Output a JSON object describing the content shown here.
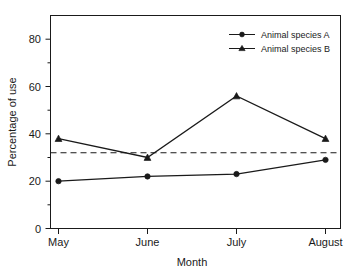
{
  "chart_data": {
    "type": "line",
    "title": "",
    "xlabel": "Month",
    "ylabel": "Percentage of use",
    "categories": [
      "May",
      "June",
      "July",
      "August"
    ],
    "series": [
      {
        "name": "Animal species A",
        "marker": "circle",
        "values": [
          20,
          22,
          23,
          29
        ]
      },
      {
        "name": "Animal species B",
        "marker": "triangle",
        "values": [
          38,
          30,
          56,
          38
        ]
      }
    ],
    "reference_line": {
      "label": "",
      "value": 32,
      "style": "dashed"
    },
    "ylim": [
      0,
      90
    ],
    "y_major_ticks": [
      0,
      20,
      40,
      60,
      80
    ],
    "y_minor_ticks": [
      10,
      30,
      50,
      70
    ],
    "grid": false,
    "legend_position": "top-right"
  },
  "axes": {
    "y_title": "Percentage of use",
    "x_title": "Month",
    "y_tick_labels": [
      "0",
      "20",
      "40",
      "60",
      "80"
    ],
    "x_tick_labels": [
      "May",
      "June",
      "July",
      "August"
    ]
  },
  "legend": {
    "entries": [
      {
        "label": "Animal species A"
      },
      {
        "label": "Animal species B"
      }
    ]
  },
  "colors": {
    "foreground": "#1a1a1a",
    "background": "#ffffff"
  }
}
